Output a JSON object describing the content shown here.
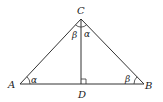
{
  "diagram": {
    "type": "geometry",
    "points": {
      "A": {
        "label": "A",
        "x": 20,
        "y": 84
      },
      "B": {
        "label": "B",
        "x": 144,
        "y": 84
      },
      "C": {
        "label": "C",
        "x": 81,
        "y": 19
      },
      "D": {
        "label": "D",
        "x": 81,
        "y": 84
      }
    },
    "segments": [
      "AB",
      "AC",
      "BC",
      "CD"
    ],
    "angles": {
      "at_A": "α",
      "at_B": "β",
      "ACD": "β",
      "DCB": "α"
    },
    "right_angle_marker": "D"
  }
}
